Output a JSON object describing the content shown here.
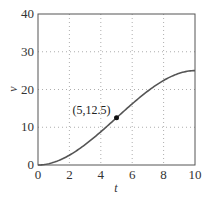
{
  "chart_data": {
    "type": "line",
    "title": "",
    "xlabel": "t",
    "ylabel": "v",
    "xlim": [
      0,
      10
    ],
    "ylim": [
      0,
      40
    ],
    "xticks": [
      0,
      2,
      4,
      6,
      8,
      10
    ],
    "yticks": [
      0,
      10,
      20,
      30,
      40
    ],
    "grid": true,
    "legend": null,
    "series": [
      {
        "name": "v(t)",
        "x": [
          0,
          1,
          2,
          3,
          4,
          5,
          6,
          7,
          8,
          9,
          10
        ],
        "values": [
          0,
          0.7,
          2.6,
          5.4,
          8.8,
          12.5,
          16.2,
          19.6,
          22.4,
          24.3,
          25
        ]
      }
    ],
    "annotations": [
      {
        "text": "(5,12.5)",
        "x": 5,
        "y": 12.5,
        "marker": "point"
      }
    ]
  },
  "labels": {
    "x": "t",
    "y": "v",
    "point": "(5,12.5)",
    "xticks": [
      "0",
      "2",
      "4",
      "6",
      "8",
      "10"
    ],
    "yticks": [
      "0",
      "10",
      "20",
      "30",
      "40"
    ]
  }
}
